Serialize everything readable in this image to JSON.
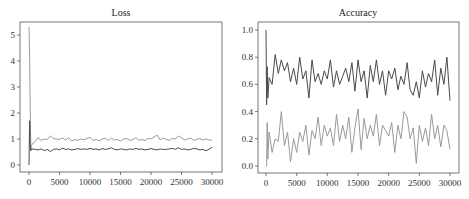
{
  "chart_data": [
    {
      "type": "line",
      "title": "Loss",
      "xlabel": "",
      "ylabel": "",
      "xlim": [
        -1500,
        31500
      ],
      "ylim": [
        -0.25,
        5.6
      ],
      "xticks": [
        0,
        5000,
        10000,
        15000,
        20000,
        25000,
        30000
      ],
      "yticks": [
        0,
        1,
        2,
        3,
        4,
        5
      ],
      "ytick_labels": [
        "0",
        "1",
        "2",
        "3",
        "4",
        "5"
      ],
      "grid": false,
      "legend": null,
      "x": [
        0,
        100,
        200,
        300,
        500,
        1000,
        1500,
        2000,
        2500,
        3000,
        3500,
        4000,
        4500,
        5000,
        5500,
        6000,
        6500,
        7000,
        7500,
        8000,
        8500,
        9000,
        9500,
        10000,
        10500,
        11000,
        11500,
        12000,
        12500,
        13000,
        13500,
        14000,
        14500,
        15000,
        15500,
        16000,
        16500,
        17000,
        17500,
        18000,
        18500,
        19000,
        19500,
        20000,
        20500,
        21000,
        21500,
        22000,
        22500,
        23000,
        23500,
        24000,
        24500,
        25000,
        25500,
        26000,
        26500,
        27000,
        27500,
        28000,
        28500,
        29000,
        29500,
        30000
      ],
      "series": [
        {
          "name": "loss_a",
          "color": "#9a9a9a",
          "values": [
            5.3,
            4.3,
            2.2,
            0.6,
            0.8,
            0.9,
            1.05,
            0.95,
            1.0,
            0.98,
            1.12,
            1.02,
            1.0,
            0.98,
            1.04,
            0.96,
            1.05,
            0.92,
            0.98,
            0.95,
            1.0,
            0.97,
            1.02,
            1.06,
            0.95,
            0.98,
            0.93,
            1.0,
            1.03,
            0.95,
            1.04,
            0.96,
            0.98,
            0.92,
            1.0,
            1.02,
            0.95,
            0.97,
            1.05,
            0.95,
            0.98,
            0.94,
            1.02,
            1.0,
            1.08,
            1.15,
            0.96,
            1.04,
            0.98,
            0.95,
            1.02,
            1.0,
            1.12,
            1.05,
            0.96,
            1.0,
            1.04,
            0.95,
            0.98,
            1.02,
            0.96,
            1.0,
            0.97,
            0.95
          ]
        },
        {
          "name": "loss_b",
          "color": "#4a4a4a",
          "values": [
            0.0,
            1.7,
            0.7,
            0.55,
            0.62,
            0.6,
            0.58,
            0.62,
            0.55,
            0.6,
            0.52,
            0.6,
            0.62,
            0.58,
            0.65,
            0.6,
            0.62,
            0.58,
            0.6,
            0.63,
            0.6,
            0.62,
            0.6,
            0.64,
            0.6,
            0.62,
            0.58,
            0.63,
            0.6,
            0.62,
            0.66,
            0.6,
            0.58,
            0.62,
            0.6,
            0.58,
            0.62,
            0.6,
            0.64,
            0.6,
            0.62,
            0.58,
            0.6,
            0.63,
            0.6,
            0.58,
            0.62,
            0.6,
            0.6,
            0.62,
            0.64,
            0.6,
            0.66,
            0.6,
            0.62,
            0.58,
            0.6,
            0.64,
            0.62,
            0.58,
            0.6,
            0.55,
            0.6,
            0.68
          ]
        }
      ]
    },
    {
      "type": "line",
      "title": "Accuracy",
      "xlabel": "",
      "ylabel": "",
      "xlim": [
        -1500,
        31500
      ],
      "ylim": [
        -0.05,
        1.06
      ],
      "xticks": [
        0,
        5000,
        10000,
        15000,
        20000,
        25000,
        30000
      ],
      "yticks": [
        0.0,
        0.2,
        0.4,
        0.6,
        0.8,
        1.0
      ],
      "ytick_labels": [
        "0.0",
        "0.2",
        "0.4",
        "0.6",
        "0.8",
        "1.0"
      ],
      "grid": false,
      "legend": null,
      "x": [
        0,
        100,
        200,
        300,
        500,
        1000,
        1500,
        2000,
        2500,
        3000,
        3500,
        4000,
        4500,
        5000,
        5500,
        6000,
        6500,
        7000,
        7500,
        8000,
        8500,
        9000,
        9500,
        10000,
        10500,
        11000,
        11500,
        12000,
        12500,
        13000,
        13500,
        14000,
        14500,
        15000,
        15500,
        16000,
        16500,
        17000,
        17500,
        18000,
        18500,
        19000,
        19500,
        20000,
        20500,
        21000,
        21500,
        22000,
        22500,
        23000,
        23500,
        24000,
        24500,
        25000,
        25500,
        26000,
        26500,
        27000,
        27500,
        28000,
        28500,
        29000,
        29500,
        30000
      ],
      "series": [
        {
          "name": "acc_a",
          "color": "#4a4a4a",
          "values": [
            1.0,
            0.45,
            0.73,
            0.5,
            0.65,
            0.6,
            0.82,
            0.68,
            0.78,
            0.7,
            0.76,
            0.62,
            0.72,
            0.6,
            0.8,
            0.64,
            0.7,
            0.5,
            0.78,
            0.62,
            0.68,
            0.6,
            0.7,
            0.64,
            0.78,
            0.58,
            0.7,
            0.6,
            0.66,
            0.72,
            0.62,
            0.76,
            0.55,
            0.78,
            0.62,
            0.7,
            0.5,
            0.74,
            0.62,
            0.78,
            0.6,
            0.7,
            0.52,
            0.7,
            0.64,
            0.72,
            0.56,
            0.66,
            0.6,
            0.76,
            0.56,
            0.52,
            0.62,
            0.5,
            0.7,
            0.58,
            0.68,
            0.62,
            0.78,
            0.52,
            0.72,
            0.6,
            0.8,
            0.48
          ]
        },
        {
          "name": "acc_b",
          "color": "#9a9a9a",
          "values": [
            0.0,
            0.0,
            0.32,
            0.05,
            0.25,
            0.1,
            0.2,
            0.18,
            0.4,
            0.15,
            0.25,
            0.03,
            0.2,
            0.1,
            0.25,
            0.18,
            0.3,
            0.08,
            0.26,
            0.2,
            0.36,
            0.15,
            0.3,
            0.22,
            0.28,
            0.15,
            0.38,
            0.18,
            0.3,
            0.2,
            0.36,
            0.1,
            0.28,
            0.42,
            0.12,
            0.35,
            0.2,
            0.3,
            0.22,
            0.38,
            0.15,
            0.3,
            0.26,
            0.22,
            0.32,
            0.1,
            0.3,
            0.2,
            0.4,
            0.36,
            0.2,
            0.28,
            0.02,
            0.3,
            0.18,
            0.28,
            0.15,
            0.38,
            0.2,
            0.3,
            0.14,
            0.3,
            0.26,
            0.12
          ]
        }
      ]
    }
  ],
  "panels": {
    "loss_title": "Loss",
    "accuracy_title": "Accuracy"
  }
}
